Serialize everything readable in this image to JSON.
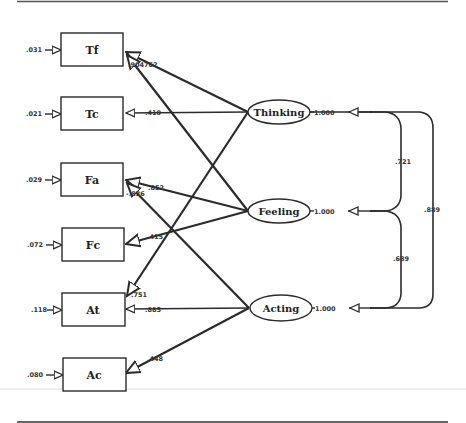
{
  "diagram": {
    "type": "structural-equation-model",
    "observed": [
      {
        "id": "Tf",
        "label": "Tf",
        "error": ".031"
      },
      {
        "id": "Tc",
        "label": "Tc",
        "error": ".021"
      },
      {
        "id": "Fa",
        "label": "Fa",
        "error": ".029"
      },
      {
        "id": "Fc",
        "label": "Fc",
        "error": ".072"
      },
      {
        "id": "At",
        "label": "At",
        "error": ".118"
      },
      {
        "id": "Ac",
        "label": "Ac",
        "error": ".080"
      }
    ],
    "latent": [
      {
        "id": "Thinking",
        "label": "Thinking",
        "variance": "1.000"
      },
      {
        "id": "Feeling",
        "label": "Feeling",
        "variance": "1.000"
      },
      {
        "id": "Acting",
        "label": "Acting",
        "variance": "1.000"
      }
    ],
    "loadings": [
      {
        "from": "Thinking",
        "to": "Tf",
        "value": ".904762"
      },
      {
        "from": "Thinking",
        "to": "Tc",
        "value": ".410"
      },
      {
        "from": "Thinking",
        "to": "At",
        "value": ".751"
      },
      {
        "from": "Feeling",
        "to": "Tf",
        "value": ""
      },
      {
        "from": "Feeling",
        "to": "Fa",
        "value": ".852"
      },
      {
        "from": "Feeling",
        "to": "Fc",
        "value": ".415"
      },
      {
        "from": "Acting",
        "to": "Fa",
        "value": "-.826"
      },
      {
        "from": "Acting",
        "to": "At",
        "value": ".885"
      },
      {
        "from": "Acting",
        "to": "Ac",
        "value": ".448"
      }
    ],
    "correlations": [
      {
        "between": [
          "Thinking",
          "Feeling"
        ],
        "value": ".721"
      },
      {
        "between": [
          "Feeling",
          "Acting"
        ],
        "value": ".689"
      },
      {
        "between": [
          "Thinking",
          "Acting"
        ],
        "value": ".889"
      }
    ]
  }
}
